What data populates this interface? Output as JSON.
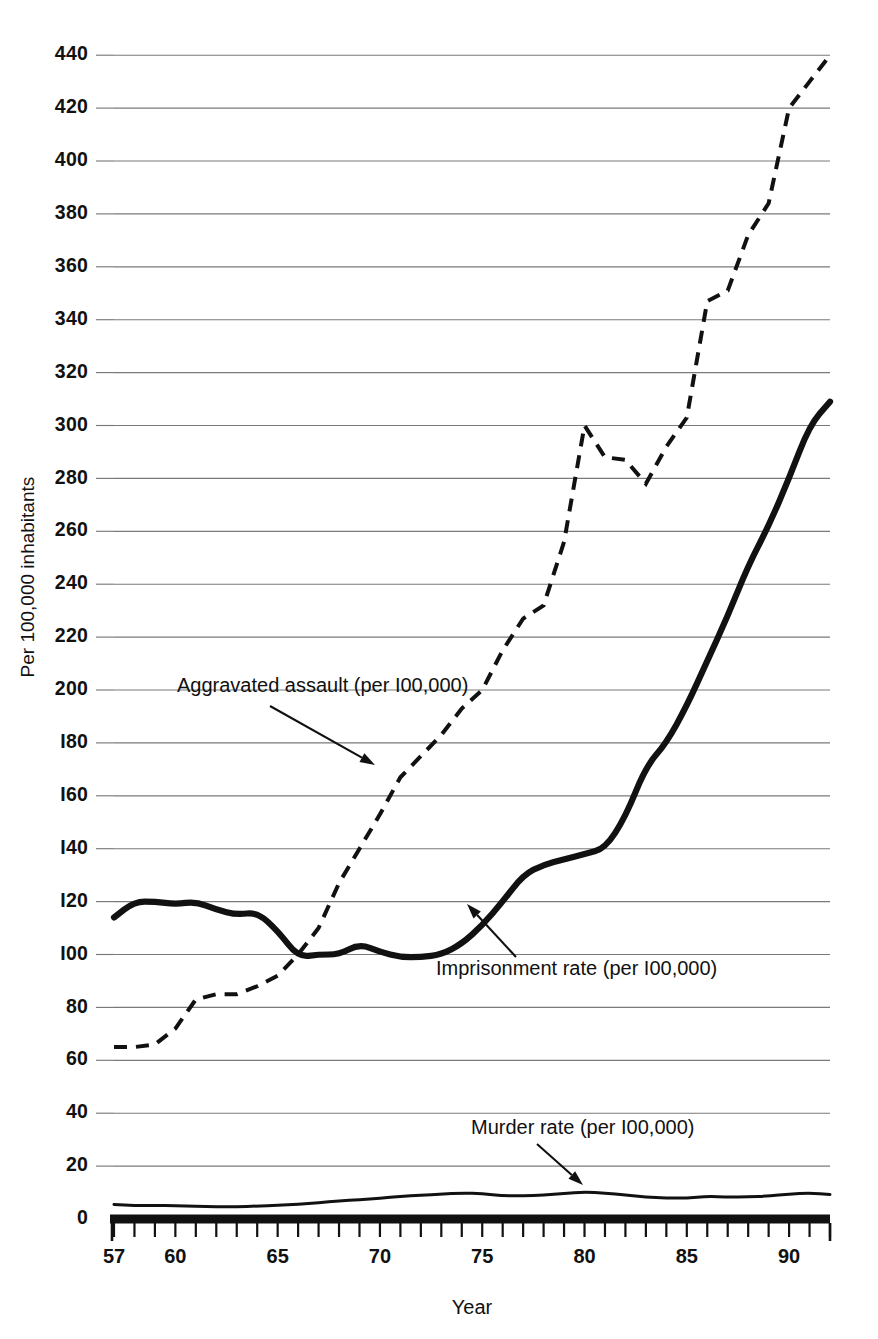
{
  "chart_data": {
    "type": "line",
    "title": "",
    "xlabel": "Year",
    "ylabel": "Per 100,000 inhabitants",
    "xlim": [
      57,
      92
    ],
    "ylim": [
      0,
      440
    ],
    "grid": true,
    "legend_position": "inline-annotations",
    "y_ticks": [
      0,
      20,
      40,
      60,
      80,
      100,
      120,
      140,
      160,
      180,
      200,
      220,
      240,
      260,
      280,
      300,
      320,
      340,
      360,
      380,
      400,
      420,
      440
    ],
    "y_tick_labels": [
      "0",
      "20",
      "40",
      "60",
      "80",
      "I00",
      "I20",
      "I40",
      "I60",
      "I80",
      "200",
      "220",
      "240",
      "260",
      "280",
      "300",
      "320",
      "340",
      "360",
      "380",
      "400",
      "420",
      "440"
    ],
    "x_ticks": [
      57,
      58,
      59,
      60,
      61,
      62,
      63,
      64,
      65,
      66,
      67,
      68,
      69,
      70,
      71,
      72,
      73,
      74,
      75,
      76,
      77,
      78,
      79,
      80,
      81,
      82,
      83,
      84,
      85,
      86,
      87,
      88,
      89,
      90,
      91,
      92
    ],
    "x_tick_labels": [
      {
        "value": 57,
        "label": "57"
      },
      {
        "value": 60,
        "label": "60"
      },
      {
        "value": 65,
        "label": "65"
      },
      {
        "value": 70,
        "label": "70"
      },
      {
        "value": 75,
        "label": "75"
      },
      {
        "value": 80,
        "label": "80"
      },
      {
        "value": 85,
        "label": "85"
      },
      {
        "value": 90,
        "label": "90"
      }
    ],
    "x": [
      57,
      58,
      59,
      60,
      61,
      62,
      63,
      64,
      65,
      66,
      67,
      68,
      69,
      70,
      71,
      72,
      73,
      74,
      75,
      76,
      77,
      78,
      79,
      80,
      81,
      82,
      83,
      84,
      85,
      86,
      87,
      88,
      89,
      90,
      91,
      92
    ],
    "series": [
      {
        "name": "Aggravated assault (per 100,000)",
        "style": "dashed",
        "values": [
          65,
          65,
          66,
          72,
          83,
          85,
          85,
          88,
          92,
          100,
          110,
          127,
          140,
          153,
          167,
          175,
          183,
          193,
          200,
          215,
          227,
          232,
          256,
          300,
          288,
          287,
          278,
          292,
          303,
          347,
          351,
          372,
          384,
          420,
          430,
          440
        ]
      },
      {
        "name": "Imprisonment rate (per 100,000)",
        "style": "solid",
        "values": [
          114,
          120,
          120,
          119,
          120,
          117,
          115,
          116,
          109,
          99,
          100,
          100,
          104,
          101,
          99,
          99,
          100,
          104,
          111,
          120,
          130,
          134,
          136,
          138,
          140,
          152,
          171,
          180,
          194,
          211,
          228,
          247,
          262,
          280,
          300,
          309
        ]
      },
      {
        "name": "Murder rate (per 100,000)",
        "style": "thin",
        "values": [
          5.5,
          5.1,
          5.1,
          5.1,
          4.8,
          4.6,
          4.6,
          4.9,
          5.1,
          5.6,
          6.2,
          6.9,
          7.3,
          7.9,
          8.6,
          9.0,
          9.4,
          9.8,
          9.6,
          8.8,
          8.8,
          9.0,
          9.7,
          10.2,
          9.8,
          9.1,
          8.3,
          7.9,
          7.9,
          8.6,
          8.3,
          8.4,
          8.7,
          9.4,
          9.8,
          9.3
        ]
      }
    ],
    "annotations": [
      {
        "text": "Aggravated assault (per I00,000)",
        "text_x": 177,
        "text_y": 692,
        "arrow_from_x": 270,
        "arrow_from_y": 706,
        "arrow_to_x": 375,
        "arrow_to_y": 765
      },
      {
        "text": "Imprisonment rate (per I00,000)",
        "text_x": 436,
        "text_y": 975,
        "arrow_from_x": 516,
        "arrow_from_y": 957,
        "arrow_to_x": 467,
        "arrow_to_y": 904
      },
      {
        "text": "Murder rate (per I00,000)",
        "text_x": 471,
        "text_y": 1134,
        "arrow_from_x": 537,
        "arrow_from_y": 1144,
        "arrow_to_x": 583,
        "arrow_to_y": 1185
      }
    ],
    "colors": {
      "line": "#111111",
      "gridline": "#7a7a7a",
      "background": "#ffffff"
    }
  }
}
